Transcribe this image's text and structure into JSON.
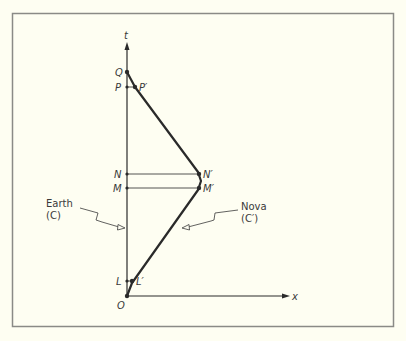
{
  "diagram": {
    "type": "spacetime-diagram",
    "colors": {
      "background": "#fefef2",
      "frame": "#8a8a86",
      "ink": "#2a2a2a",
      "text": "#3a3a3a"
    },
    "axes": {
      "t_label": "t",
      "x_label": "x",
      "origin_label": "O"
    },
    "earth_points": {
      "Q": "Q",
      "P": "P",
      "N": "N",
      "M": "M",
      "L": "L"
    },
    "nova_points": {
      "P_prime": "P′",
      "N_prime": "N′",
      "M_prime": "M′",
      "L_prime": "L′"
    },
    "callouts": {
      "earth_name": "Earth",
      "earth_symbol": "(C)",
      "nova_name": "Nova",
      "nova_symbol": "(C′)"
    }
  }
}
